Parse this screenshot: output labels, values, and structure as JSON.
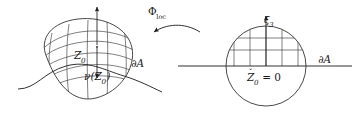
{
  "figure": {
    "width": 358,
    "height": 115,
    "background_color": "#ffffff",
    "stroke_color": "#1a1a1a",
    "grid_stroke_color": "#3a3a3a"
  },
  "labels": {
    "map_name": "Φ",
    "map_subscript": "loc",
    "left_point": "Z",
    "left_point_subscript": "0",
    "normal_vector": "ν(Z",
    "normal_vector_subscript": "0",
    "normal_vector_close": ")",
    "boundary_left": "∂A",
    "boundary_left_partial": "∂",
    "boundary_left_set": "A",
    "axis_name": "ξ",
    "axis_subscript": "3",
    "right_point": "Z",
    "right_point_subscript": "0",
    "right_point_equation": " = 0",
    "right_point_accent": "ˇ",
    "boundary_right_partial": "∂",
    "boundary_right_set": "A"
  },
  "left_panel": {
    "name": "curved-boundary-region",
    "description": "Deformed blob with warped curvilinear grid, outward normal arrow up and inward normal nu(Z0) down, wavy boundary curve dA",
    "blob_path": "M 47 58 C 38 38, 52 22, 78 19 C 104 16, 128 28, 132 48 C 136 68, 120 92, 96 98 C 72 104, 56 82, 47 58 Z",
    "boundary_curve_path": "M 18 89 C 36 89, 44 72, 66 66 C 88 60, 104 70, 124 76 C 140 81, 150 87, 162 92",
    "normal_up_arrow": {
      "x1": 97,
      "y1": 41,
      "x2": 97,
      "y2": 6
    },
    "normal_down_arrow": {
      "x1": 97,
      "y1": 47,
      "x2": 97,
      "y2": 79
    }
  },
  "right_panel": {
    "name": "flat-half-space-model",
    "description": "Circle bisected by horizontal boundary line dA, vertical xi3 axis, rectangular grid in upper half, Z0 = 0 at origin",
    "circle": {
      "cx": 266,
      "cy": 65,
      "r": 40
    },
    "boundary_line": {
      "x1": 178,
      "y1": 66,
      "x2": 352,
      "y2": 66
    },
    "axis_arrow": {
      "x1": 266,
      "y1": 66,
      "x2": 266,
      "y2": 16
    },
    "grid_vertical_x": [
      234,
      250,
      266,
      282,
      298
    ],
    "grid_horizontal_y": [
      38,
      50,
      66
    ]
  },
  "arrow": {
    "name": "phi-loc-arrow",
    "direction": "right-to-left",
    "path": "M 199 31 C 183 22, 165 24, 152 32",
    "head_at": {
      "x": 152,
      "y": 32
    }
  }
}
